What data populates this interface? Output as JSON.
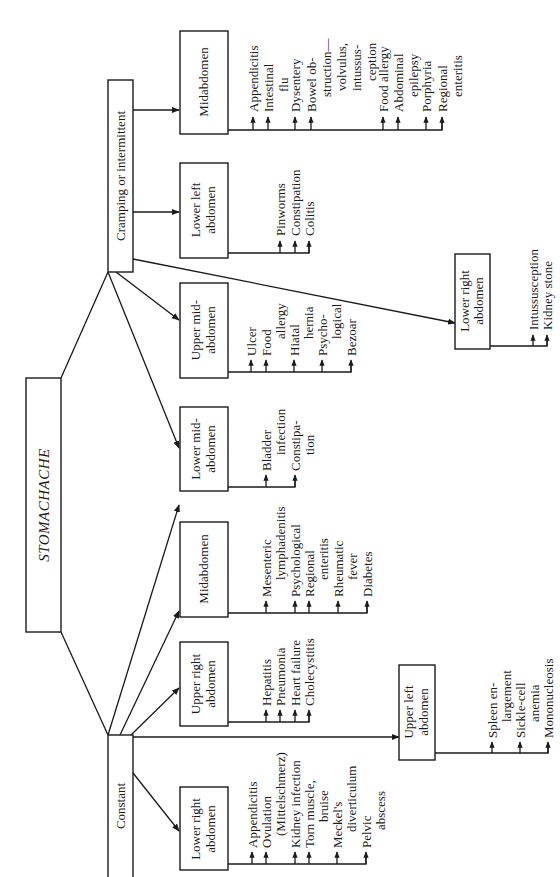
{
  "diagram": {
    "root": "STOMACHACHE",
    "branches": [
      {
        "label": "Cramping or intermittent",
        "regions": [
          {
            "label_lines": [
              "Midabdomen"
            ],
            "causes": [
              [
                "Appendicitis"
              ],
              [
                "Intestinal",
                "flu"
              ],
              [
                "Dysentery"
              ],
              [
                "Bowel ob-",
                "struction—",
                "volvulus,",
                "intussus-",
                "ception"
              ],
              [
                "Food allergy"
              ],
              [
                "Abdominal",
                "epilepsy"
              ],
              [
                "Porphyria"
              ],
              [
                "Regional",
                "enteritis"
              ]
            ]
          },
          {
            "label_lines": [
              "Lower left",
              "abdomen"
            ],
            "causes": [
              [
                "Pinworms"
              ],
              [
                "Constipation"
              ],
              [
                "Colitis"
              ]
            ]
          },
          {
            "label_lines": [
              "Upper mid-",
              "abdomen"
            ],
            "causes": [
              [
                "Ulcer"
              ],
              [
                "Food",
                "allergy"
              ],
              [
                "Hiatal",
                "hernia"
              ],
              [
                "Psycho-",
                "logical"
              ],
              [
                "Bezoar"
              ]
            ]
          },
          {
            "label_lines": [
              "Lower mid-",
              "abdomen"
            ],
            "causes": [
              [
                "Bladder",
                "infection"
              ],
              [
                "Constipa-",
                "tion"
              ]
            ]
          },
          {
            "label_lines": [
              "Lower right",
              "abdomen"
            ],
            "causes": [
              [
                "Intussusception"
              ],
              [
                "Kidney stone"
              ]
            ]
          }
        ]
      },
      {
        "label": "Constant",
        "regions": [
          {
            "label_lines": [
              "Midabdomen"
            ],
            "causes": [
              [
                "Mesenteric",
                "lymphadenitis"
              ],
              [
                "Psychological"
              ],
              [
                "Regional",
                "enteritis"
              ],
              [
                "Rheumatic",
                "fever"
              ],
              [
                "Diabetes"
              ]
            ]
          },
          {
            "label_lines": [
              "Upper right",
              "abdomen"
            ],
            "causes": [
              [
                "Hepatitis"
              ],
              [
                "Pneumonia"
              ],
              [
                "Heart failure"
              ],
              [
                "Cholecystitis"
              ]
            ]
          },
          {
            "label_lines": [
              "Lower right",
              "abdomen"
            ],
            "causes": [
              [
                "Appendicitis"
              ],
              [
                "Ovulation",
                "(Mittelschmerz)"
              ],
              [
                "Kidney infection"
              ],
              [
                "Torn muscle,",
                "bruise"
              ],
              [
                "Meckel's",
                "diverticulum"
              ],
              [
                "Pelvic",
                "abscess"
              ]
            ]
          },
          {
            "label_lines": [
              "Upper left",
              "abdomen"
            ],
            "causes": [
              [
                "Spleen en-",
                "largement"
              ],
              [
                "Sickle-cell",
                "anemia"
              ],
              [
                "Mononucleosis"
              ]
            ]
          }
        ]
      }
    ]
  },
  "text": {
    "root": "STOMACHACHE",
    "cramping": "Cramping or intermittent",
    "constant": "Constant",
    "c_mid": "Midabdomen",
    "c_ll_1": "Lower left",
    "c_ll_2": "abdomen",
    "c_um_1": "Upper mid-",
    "c_um_2": "abdomen",
    "c_lm_1": "Lower mid-",
    "c_lm_2": "abdomen",
    "c_lr_1": "Lower right",
    "c_lr_2": "abdomen",
    "k_mid": "Midabdomen",
    "k_ur_1": "Upper right",
    "k_ur_2": "abdomen",
    "k_lr_1": "Lower right",
    "k_lr_2": "abdomen",
    "k_ul_1": "Upper left",
    "k_ul_2": "abdomen",
    "cm_1": "Appendicitis",
    "cm_2a": "Intestinal",
    "cm_2b": "flu",
    "cm_3": "Dysentery",
    "cm_4a": "Bowel ob-",
    "cm_4b": "struction—",
    "cm_4c": "volvulus,",
    "cm_4d": "intussus-",
    "cm_4e": "ception",
    "cm_5": "Food allergy",
    "cm_6a": "Abdominal",
    "cm_6b": "epilepsy",
    "cm_7": "Porphyria",
    "cm_8a": "Regional",
    "cm_8b": "enteritis",
    "cll_1": "Pinworms",
    "cll_2": "Constipation",
    "cll_3": "Colitis",
    "cum_1": "Ulcer",
    "cum_2a": "Food",
    "cum_2b": "allergy",
    "cum_3a": "Hiatal",
    "cum_3b": "hernia",
    "cum_4a": "Psycho-",
    "cum_4b": "logical",
    "cum_5": "Bezoar",
    "clm_1a": "Bladder",
    "clm_1b": "infection",
    "clm_2a": "Constipa-",
    "clm_2b": "tion",
    "clr_1": "Intussusception",
    "clr_2": "Kidney stone",
    "km_1a": "Mesenteric",
    "km_1b": "lymphadenitis",
    "km_2": "Psychological",
    "km_3a": "Regional",
    "km_3b": "enteritis",
    "km_4a": "Rheumatic",
    "km_4b": "fever",
    "km_5": "Diabetes",
    "kur_1": "Hepatitis",
    "kur_2": "Pneumonia",
    "kur_3": "Heart failure",
    "kur_4": "Cholecystitis",
    "klr_1": "Appendicitis",
    "klr_2a": "Ovulation",
    "klr_2b": "(Mittelschmerz)",
    "klr_3": "Kidney infection",
    "klr_4a": "Torn muscle,",
    "klr_4b": "bruise",
    "klr_5a": "Meckel's",
    "klr_5b": "diverticulum",
    "klr_6a": "Pelvic",
    "klr_6b": "abscess",
    "kul_1a": "Spleen en-",
    "kul_1b": "largement",
    "kul_2a": "Sickle-cell",
    "kul_2b": "anemia",
    "kul_3": "Mononucleosis"
  }
}
